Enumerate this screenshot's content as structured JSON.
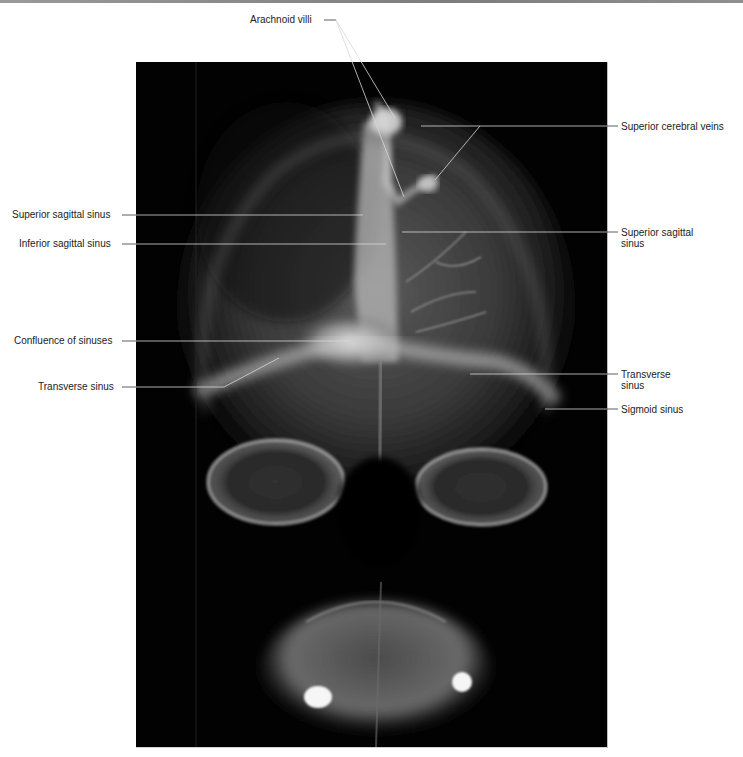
{
  "figure": {
    "type": "radiograph",
    "view": "anterior-posterior skull venogram",
    "colors": {
      "background": "#ffffff",
      "xray_bg": "#020202",
      "label_text": "#222222",
      "leader_line_on_white": "#333333",
      "leader_line_on_xray": "#d8d8d8"
    }
  },
  "labels": {
    "arachnoid_villi": "Arachnoid villi",
    "superior_cerebral_veins": "Superior cerebral veins",
    "superior_sagittal_sinus_left": "Superior sagittal sinus",
    "inferior_sagittal_sinus": "Inferior sagittal sinus",
    "superior_sagittal_sinus_right_line1": "Superior sagittal",
    "superior_sagittal_sinus_right_line2": "sinus",
    "confluence_of_sinuses": "Confluence of sinuses",
    "transverse_sinus_left": "Transverse sinus",
    "transverse_sinus_right_line1": "Transverse",
    "transverse_sinus_right_line2": "sinus",
    "sigmoid_sinus": "Sigmoid sinus"
  }
}
